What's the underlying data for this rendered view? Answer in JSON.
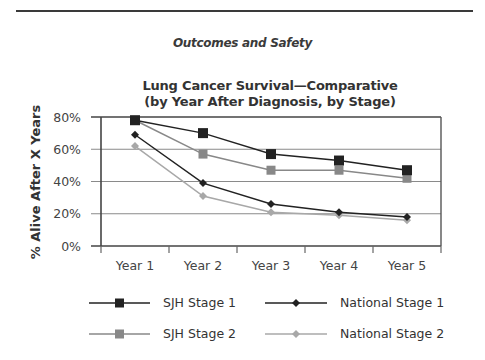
{
  "header": {
    "section_title": "Outcomes and Safety"
  },
  "chart_data": {
    "type": "line",
    "title": "Lung Cancer Survival—Comparative",
    "subtitle": "(by Year After Diagnosis, by Stage)",
    "xlabel": "",
    "ylabel": "% Alive After X Years",
    "categories": [
      "Year 1",
      "Year 2",
      "Year 3",
      "Year 4",
      "Year 5"
    ],
    "ylim": [
      0,
      80
    ],
    "yticks": [
      "0%",
      "20%",
      "40%",
      "60%",
      "80%"
    ],
    "grid": true,
    "legend_position": "bottom",
    "series": [
      {
        "name": "SJH Stage 1",
        "marker": "square",
        "color": "#222222",
        "values": [
          78,
          70,
          57,
          53,
          47
        ]
      },
      {
        "name": "National Stage 1",
        "marker": "diamond",
        "color": "#222222",
        "values": [
          69,
          39,
          26,
          21,
          18
        ]
      },
      {
        "name": "SJH Stage 2",
        "marker": "square",
        "color": "#888888",
        "values": [
          78,
          57,
          47,
          47,
          42
        ]
      },
      {
        "name": "National Stage 2",
        "marker": "diamond",
        "color": "#a8a8a8",
        "values": [
          62,
          31,
          21,
          19,
          16
        ]
      }
    ]
  },
  "legend": {
    "items": [
      {
        "label": "SJH Stage 1"
      },
      {
        "label": "National Stage 1"
      },
      {
        "label": "SJH Stage 2"
      },
      {
        "label": "National Stage 2"
      }
    ]
  }
}
